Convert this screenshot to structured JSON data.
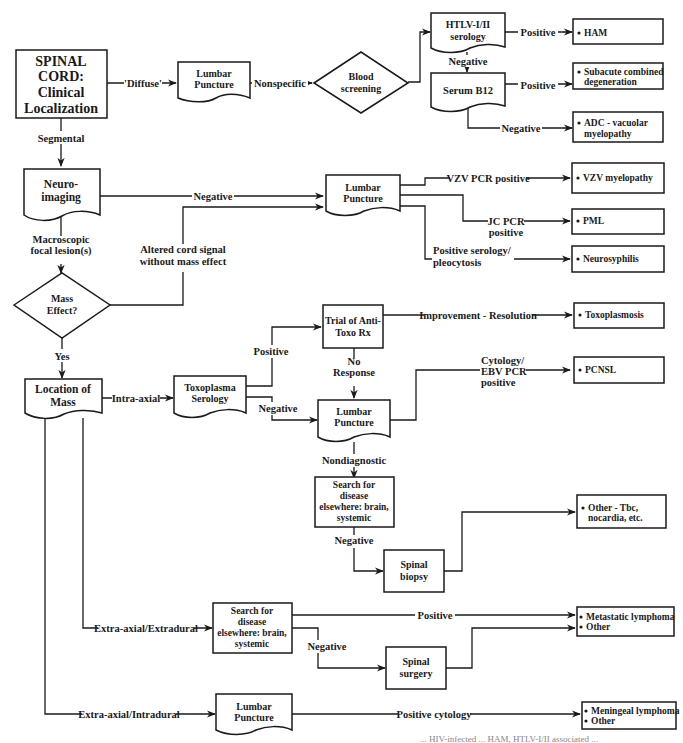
{
  "title_node": {
    "lines": [
      "SPINAL",
      "CORD:",
      "Clinical",
      "Localization"
    ]
  },
  "nodes": {
    "lp_top": {
      "lines": [
        "Lumbar",
        "Puncture"
      ]
    },
    "blood": {
      "lines": [
        "Blood",
        "screening"
      ]
    },
    "htlv": {
      "lines": [
        "HTLV-I/II",
        "serology"
      ]
    },
    "b12": {
      "lines": [
        "Serum B12"
      ]
    },
    "neuroimaging": {
      "lines": [
        "Neuro-",
        "imaging"
      ]
    },
    "lp_mid": {
      "lines": [
        "Lumbar",
        "Puncture"
      ]
    },
    "mass_effect": {
      "lines": [
        "Mass",
        "Effect?"
      ]
    },
    "location": {
      "lines": [
        "Location of",
        "Mass"
      ]
    },
    "toxo": {
      "lines": [
        "Toxoplasma",
        "Serology"
      ]
    },
    "trial": {
      "lines": [
        "Trial of Anti-",
        "Toxo Rx"
      ]
    },
    "lp_lower": {
      "lines": [
        "Lumbar",
        "Puncture"
      ]
    },
    "search1": {
      "lines": [
        "Search for",
        "disease",
        "elsewhere: brain,",
        "systemic"
      ]
    },
    "biopsy": {
      "lines": [
        "Spinal",
        "biopsy"
      ]
    },
    "search2": {
      "lines": [
        "Search for",
        "disease",
        "elsewhere: brain,",
        "systemic"
      ]
    },
    "surgery": {
      "lines": [
        "Spinal",
        "surgery"
      ]
    },
    "lp_bottom": {
      "lines": [
        "Lumbar",
        "Puncture"
      ]
    }
  },
  "outcomes": {
    "ham": [
      "HAM"
    ],
    "scd": [
      "Subacute combined",
      "degeneration"
    ],
    "adc": [
      "ADC - vacuolar",
      "myelopathy"
    ],
    "vzv": [
      "VZV myelopathy"
    ],
    "pml": [
      "PML"
    ],
    "neurosyph": [
      "Neurosyphilis"
    ],
    "toxoplasmosis": [
      "Toxoplasmosis"
    ],
    "pcnsl": [
      "PCNSL"
    ],
    "other_tbc": [
      "Other - Tbc,",
      "nocardia, etc."
    ],
    "metastatic": [
      "Metastatic lymphoma",
      "Other"
    ],
    "meningeal": [
      "Meningeal lymphoma",
      "Other"
    ]
  },
  "edge_labels": {
    "diffuse": "'Diffuse'",
    "nonspecific": "Nonspecific",
    "htlv_pos": "Positive",
    "htlv_neg": "Negative",
    "b12_pos": "Positive",
    "b12_neg": "Negative",
    "segmental": "Segmental",
    "neuro_neg": "Negative",
    "macroscopic": [
      "Macroscopic",
      "focal lesion(s)"
    ],
    "altered": [
      "Altered cord signal",
      "without mass effect"
    ],
    "vzv_pcr": "VZV PCR positive",
    "jc_pcr": [
      "JC PCR",
      "positive"
    ],
    "pos_serology": [
      "Positive serology/",
      "pleocytosis"
    ],
    "yes": "Yes",
    "intra_axial": "Intra-axial",
    "toxo_pos": "Positive",
    "toxo_neg": "Negative",
    "improvement": "Improvement - Resolution",
    "no_response": [
      "No",
      "Response"
    ],
    "cytology_ebv": [
      "Cytology/",
      "EBV PCR",
      "positive"
    ],
    "nondiagnostic": "Nondiagnostic",
    "search1_neg": "Negative",
    "extradural": "Extra-axial/Extradural",
    "search2_pos": "Positive",
    "search2_neg": "Negative",
    "intradural": "Extra-axial/Intradural",
    "pos_cytology": "Positive cytology"
  },
  "caption": "... HIV-infected ... HAM, HTLV-I/II associated ..."
}
